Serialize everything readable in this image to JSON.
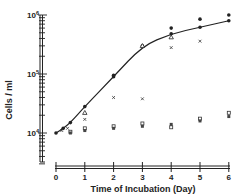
{
  "chart_data": {
    "type": "scatter",
    "title": "",
    "xlabel": "Time of Incubation (Day)",
    "ylabel": "Cells / ml",
    "yscale": "log",
    "ylim": [
      3000,
      1000000
    ],
    "xlim": [
      0,
      6
    ],
    "x_ticks": [
      "0",
      "1",
      "2",
      "3",
      "4",
      "5",
      "6"
    ],
    "y_ticks": [
      {
        "value": 10000,
        "label": "10",
        "exp": "4"
      },
      {
        "value": 100000,
        "label": "10",
        "exp": "5"
      },
      {
        "value": 1000000,
        "label": "10",
        "exp": "6"
      }
    ],
    "grid": false,
    "legend": null,
    "series": [
      {
        "name": "growth-curve (filled circles)",
        "marker": "filled-circle",
        "line": true,
        "x": [
          0,
          0.25,
          0.5,
          1,
          2,
          3,
          4,
          5,
          6
        ],
        "values": [
          10000,
          12000,
          15000,
          28000,
          90000,
          300000,
          480000,
          620000,
          800000
        ]
      },
      {
        "name": "filled circles (upper)",
        "marker": "filled-circle",
        "line": false,
        "x": [
          2,
          4,
          5,
          6
        ],
        "values": [
          95000,
          600000,
          850000,
          1000000
        ]
      },
      {
        "name": "open triangles",
        "marker": "open-triangle",
        "line": false,
        "x": [
          1,
          3,
          4
        ],
        "values": [
          22000,
          300000,
          420000
        ]
      },
      {
        "name": "crosses",
        "marker": "x",
        "line": false,
        "x": [
          0.2,
          0.4,
          1,
          2,
          3,
          4,
          5
        ],
        "values": [
          11000,
          12000,
          17000,
          40000,
          38000,
          280000,
          360000
        ]
      },
      {
        "name": "open squares (flat)",
        "marker": "open-square",
        "line": false,
        "x": [
          0.5,
          1,
          2,
          3,
          4,
          5,
          6
        ],
        "values": [
          10500,
          12000,
          13000,
          14500,
          12500,
          17500,
          22000
        ]
      },
      {
        "name": "filled squares (flat)",
        "marker": "filled-square",
        "line": false,
        "x": [
          0.5,
          1,
          2,
          3,
          4,
          5,
          6
        ],
        "values": [
          10000,
          11000,
          12000,
          13000,
          14000,
          16000,
          19000
        ]
      }
    ]
  },
  "labels": {
    "ylabel": "Cells / ml",
    "xlabel": "Time of Incubation (Day)",
    "x_ticks": [
      "0",
      "1",
      "2",
      "3",
      "4",
      "5",
      "6"
    ],
    "y_base": "10",
    "y_exp": [
      "6",
      "5",
      "4"
    ]
  },
  "colors": {
    "ink": "#222222",
    "background": "#ffffff"
  }
}
